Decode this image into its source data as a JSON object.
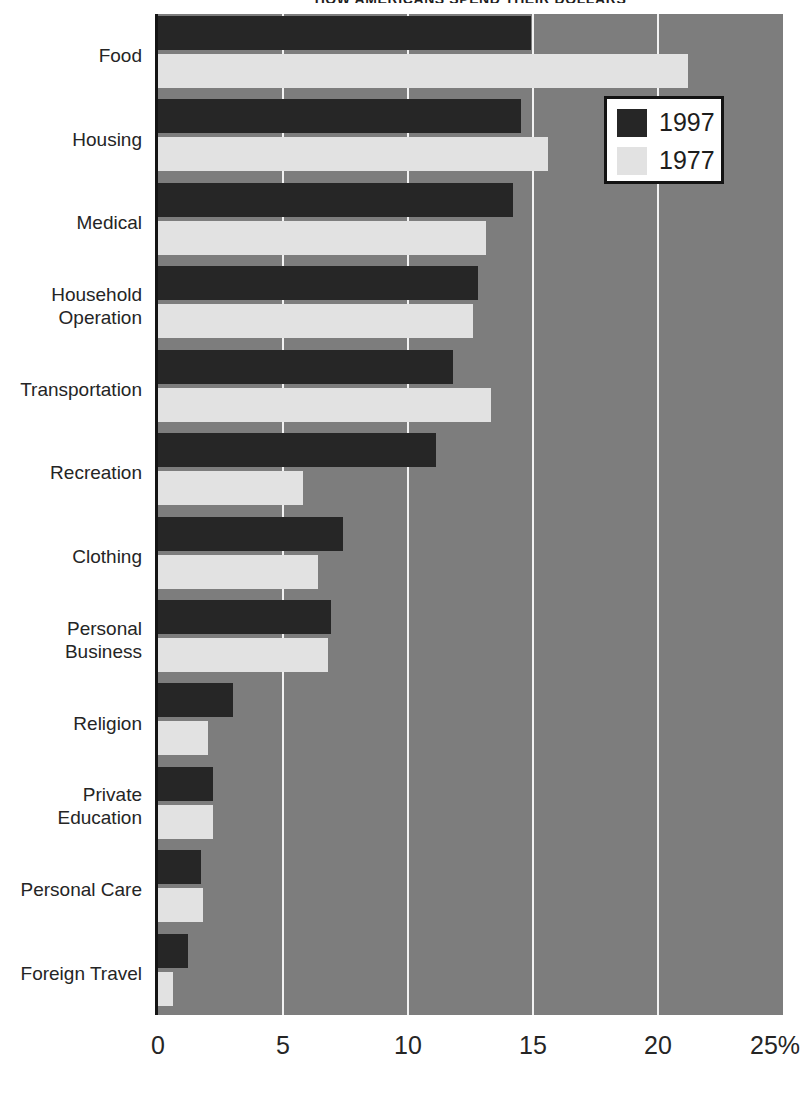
{
  "chart_data": {
    "type": "bar",
    "orientation": "horizontal",
    "title": "HOW AMERICANS SPEND THEIR DOLLARS",
    "xlabel": "",
    "ylabel": "",
    "xlim": [
      0,
      25
    ],
    "xticks": [
      0,
      5,
      10,
      15,
      20,
      25
    ],
    "xtick_labels": [
      "0",
      "5",
      "10",
      "15",
      "20",
      "25%"
    ],
    "grid": true,
    "grid_axis": "x",
    "legend_position": "top-right",
    "categories": [
      "Food",
      "Housing",
      "Medical",
      "Household\nOperation",
      "Transportation",
      "Recreation",
      "Clothing",
      "Personal\nBusiness",
      "Religion",
      "Private\nEducation",
      "Personal Care",
      "Foreign Travel"
    ],
    "series": [
      {
        "name": "1997",
        "color": "#262626",
        "values": [
          14.9,
          14.5,
          14.2,
          12.8,
          11.8,
          11.1,
          7.4,
          6.9,
          3.0,
          2.2,
          1.7,
          1.2
        ]
      },
      {
        "name": "1977",
        "color": "#e2e2e2",
        "values": [
          21.2,
          15.6,
          13.1,
          12.6,
          13.3,
          5.8,
          6.4,
          6.8,
          2.0,
          2.2,
          1.8,
          0.6
        ]
      }
    ],
    "plot_background": "#7d7d7d",
    "gridline_color": "#f2f2f2",
    "axis_color": "#141414"
  },
  "legend": {
    "items": [
      {
        "label": "1997",
        "swatch": "#262626"
      },
      {
        "label": "1977",
        "swatch": "#e2e2e2"
      }
    ]
  }
}
